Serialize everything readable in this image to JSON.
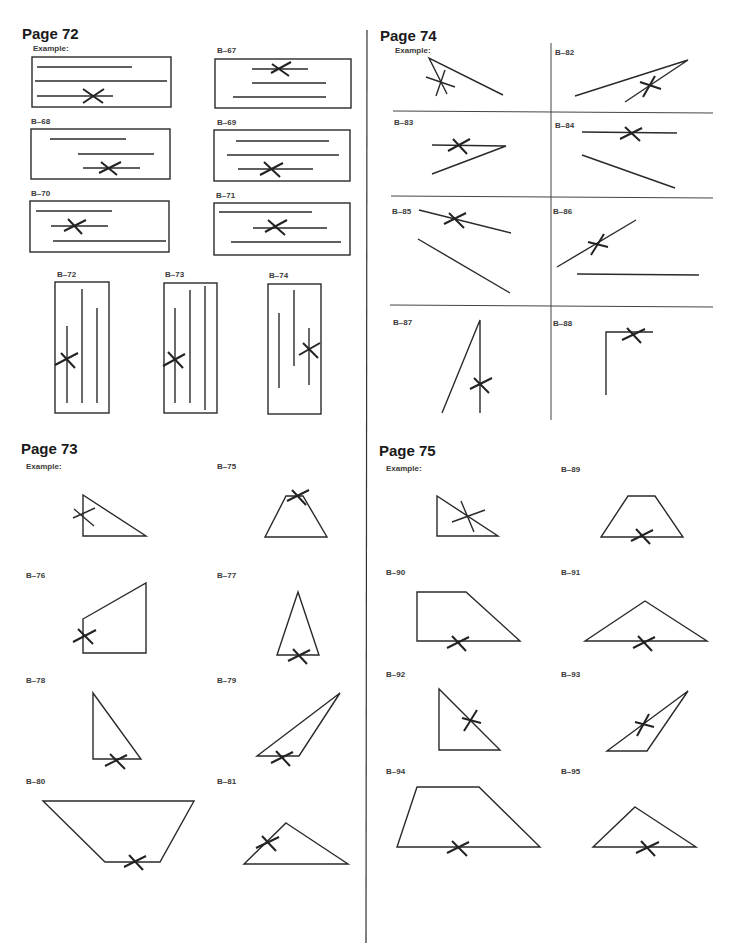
{
  "sections": [
    {
      "id": "p72",
      "title": "Page 72",
      "items": [
        "Example:",
        "B–67",
        "B–68",
        "B–69",
        "B–70",
        "B–71",
        "B–72",
        "B–73",
        "B–74"
      ]
    },
    {
      "id": "p74",
      "title": "Page 74",
      "items": [
        "Example:",
        "B–82",
        "B–83",
        "B–84",
        "B–85",
        "B–86",
        "B–87",
        "B–88"
      ]
    },
    {
      "id": "p73",
      "title": "Page 73",
      "items": [
        "Example:",
        "B–75",
        "B–76",
        "B–77",
        "B–78",
        "B–79",
        "B–80",
        "B–81"
      ]
    },
    {
      "id": "p75",
      "title": "Page 75",
      "items": [
        "Example:",
        "B–89",
        "B–90",
        "B–91",
        "B–92",
        "B–93",
        "B–94",
        "B–95"
      ]
    }
  ],
  "colors": {
    "ink": "#2a2a2a",
    "paper": "#ffffff"
  }
}
